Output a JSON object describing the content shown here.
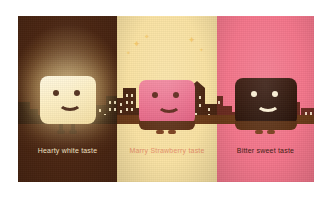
{
  "poster": {
    "title": "Three chocolate taste characters",
    "panels": [
      {
        "key": "white",
        "caption": "Hearty white taste",
        "character_name": "white-chocolate-character",
        "background_color": "#4a2511",
        "body_color": "#fdeec0",
        "caption_color": "#f3e3c4",
        "expression": "smiling",
        "eyes": 2,
        "has_glow": "yes",
        "has_sparkles": "no"
      },
      {
        "key": "strawberry",
        "caption": "Marry Strawberry taste",
        "character_name": "strawberry-chocolate-character",
        "background_color": "#fae3a4",
        "body_color": "#ec6f8d",
        "caption_color": "#e8926a",
        "expression": "smiling",
        "eyes": 2,
        "has_glow": "no",
        "has_sparkles": "yes"
      },
      {
        "key": "bitter",
        "caption": "Bitter sweet taste",
        "character_name": "dark-chocolate-character",
        "background_color": "#f4768b",
        "body_color": "#2e1409",
        "caption_color": "#40190f",
        "expression": "smiling",
        "eyes": 2,
        "has_glow": "no",
        "has_sparkles": "no"
      }
    ],
    "sparkle_glyph": "✦",
    "scenery": {
      "skyline_label": "city-skyline-silhouette",
      "ground_label": "ground-shelf"
    }
  }
}
